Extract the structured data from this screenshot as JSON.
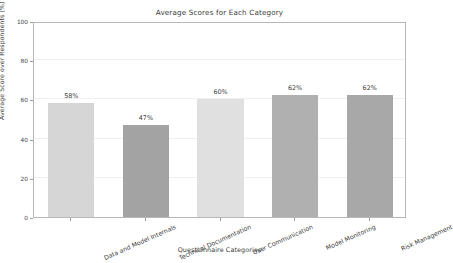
{
  "chart_data": {
    "type": "bar",
    "title": "Average Scores for Each Category",
    "xlabel": "Questionnaire Categories",
    "ylabel": "Average Score over Respondents (%)",
    "categories": [
      "Data and Model Internals",
      "Technical Documentation",
      "User Communication",
      "Model Monitoring",
      "Risk Management"
    ],
    "values": [
      58,
      47,
      60,
      62,
      62
    ],
    "value_labels": [
      "58%",
      "47%",
      "60%",
      "62%",
      "62%"
    ],
    "bar_colors": [
      "#d6d6d6",
      "#a3a3a3",
      "#e0e0e0",
      "#b0b0b0",
      "#a8a8a8"
    ],
    "ylim": [
      0,
      100
    ],
    "yticks": [
      0,
      20,
      40,
      60,
      80,
      100
    ],
    "ytick_labels": [
      "0",
      "20",
      "40",
      "60",
      "80",
      "100"
    ],
    "grid": true,
    "legend": "none",
    "background_color": "#ffffff",
    "axes_color": "#b8b8b8",
    "text_color": "#3b3b3b"
  }
}
